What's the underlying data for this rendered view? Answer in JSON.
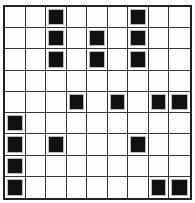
{
  "grid": {
    "rows": 9,
    "cols": 9,
    "fill_color": "#111111",
    "cells": [
      [
        0,
        0,
        1,
        0,
        0,
        0,
        1,
        0,
        0
      ],
      [
        0,
        0,
        1,
        0,
        1,
        0,
        1,
        0,
        0
      ],
      [
        0,
        0,
        1,
        0,
        1,
        0,
        1,
        0,
        0
      ],
      [
        0,
        0,
        0,
        0,
        0,
        0,
        0,
        0,
        0
      ],
      [
        0,
        0,
        0,
        1,
        0,
        1,
        0,
        1,
        1
      ],
      [
        1,
        0,
        0,
        0,
        0,
        0,
        0,
        0,
        0
      ],
      [
        1,
        0,
        1,
        0,
        0,
        0,
        1,
        0,
        0
      ],
      [
        1,
        0,
        0,
        0,
        0,
        0,
        0,
        0,
        0
      ],
      [
        1,
        0,
        0,
        0,
        0,
        0,
        0,
        1,
        1
      ]
    ]
  }
}
